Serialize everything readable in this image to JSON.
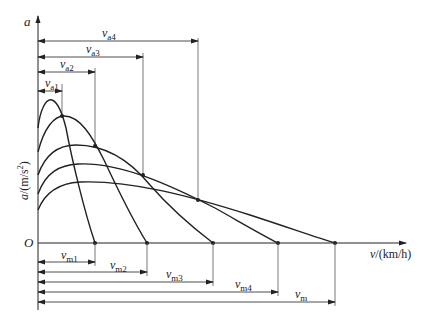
{
  "diagram": {
    "title": "",
    "y_axis": {
      "symbol": "a",
      "label_var": "a",
      "label_unit": "/(m/s",
      "label_sup": "2",
      "label_close": ")"
    },
    "x_axis": {
      "label_var": "v",
      "label_unit": "/(km/h)"
    },
    "origin": "O",
    "top_dimensions": [
      {
        "var": "v",
        "sub": "a1"
      },
      {
        "var": "v",
        "sub": "a2"
      },
      {
        "var": "v",
        "sub": "a3"
      },
      {
        "var": "v",
        "sub": "a4"
      }
    ],
    "bottom_dimensions": [
      {
        "var": "v",
        "sub": "m1"
      },
      {
        "var": "v",
        "sub": "m2"
      },
      {
        "var": "v",
        "sub": "m3"
      },
      {
        "var": "v",
        "sub": "m4"
      },
      {
        "var": "v",
        "sub": "m"
      }
    ],
    "curves_count": 5,
    "colors": {
      "line": "#222222",
      "thin": "#555555"
    }
  }
}
